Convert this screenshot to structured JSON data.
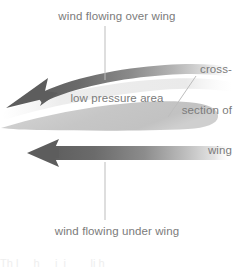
{
  "figure": {
    "background_color": "#ffffff",
    "text_color": "#7b7b7b",
    "width": 234,
    "height": 268
  },
  "labels": {
    "over_wing": "wind flowing over wing",
    "under_wing": "wind flowing under wing",
    "low_pressure": "low pressure area",
    "cross_section_line1": "cross-",
    "cross_section_line2": "section of",
    "cross_section_line3": "wing"
  },
  "elements": {
    "top_arrow_name": "curved airflow arrow over wing",
    "bottom_arrow_name": "straight airflow arrow under wing",
    "wing_name": "wing cross-section airfoil",
    "leader_top_name": "leader line to over-wing label",
    "leader_bottom_name": "leader line to under-wing label",
    "leader_wing_name": "leader line to wing cross-section label"
  },
  "colors": {
    "arrow_dark": "#5f5f5f",
    "arrow_mid": "#8d8d8d",
    "arrow_fade": "#ffffff",
    "wing_fill": "#c9c9c9",
    "wing_fill_light": "#dddddd",
    "leader_line": "#b8b8b8",
    "text": "#7b7b7b"
  },
  "smudge": {
    "bottom_clipped_text": "Th l     h     i  i        li h "
  }
}
